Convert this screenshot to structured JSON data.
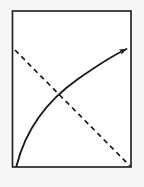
{
  "figure": {
    "title": "",
    "caption": "",
    "width": 144,
    "height": 187,
    "background_color": "#f7f7f7",
    "panel": {
      "name": "bounding-rectangle",
      "fill_color": "#ffffff",
      "stroke_color": "#1a1a1a",
      "stroke_width": 1.6,
      "x": 12.5,
      "y": 11.0,
      "width": 118.5,
      "height": 156.0
    },
    "elements": [
      {
        "name": "dashed-diagonal-line",
        "kind": "line",
        "style": "dashed",
        "stroke_color": "#1a1a1a",
        "stroke_width": 1.7,
        "dash_pattern": "5 4",
        "from": [
          15,
          50
        ],
        "to": [
          130,
          166
        ],
        "has_arrowhead": false
      },
      {
        "name": "solid-curved-arrow",
        "kind": "curve",
        "style": "solid",
        "stroke_color": "#1a1a1a",
        "stroke_width": 1.9,
        "path": "M 16.5 166 C 26 128, 48 100, 78 79 C 98 65, 114 55, 126.5 49",
        "has_arrowhead": true,
        "arrow_tip": [
          128,
          48
        ],
        "arrow_size": 9
      },
      {
        "name": "line-intersection-point",
        "kind": "point",
        "x": 58,
        "y": 94,
        "visible": false
      }
    ]
  }
}
